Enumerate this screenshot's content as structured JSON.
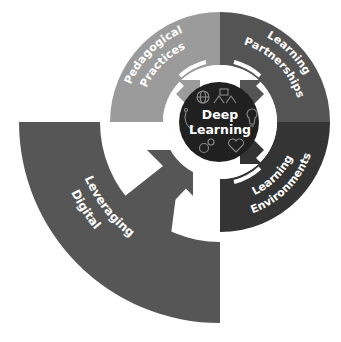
{
  "center": {
    "line1": "Deep",
    "line2": "Learning",
    "color": "#202020",
    "icons": [
      "globe-icon",
      "people-network-icon",
      "lightbulb-icon",
      "headset-icon",
      "gears-icon",
      "heart-icon"
    ]
  },
  "quadrants": [
    {
      "id": "pedagogical-practices",
      "line1": "Pedagogical",
      "line2": "Practices",
      "color": "#9b9b9b"
    },
    {
      "id": "learning-partnerships",
      "line1": "Learning",
      "line2": "Partnerships",
      "color": "#545454"
    },
    {
      "id": "learning-environments",
      "line1": "Learning",
      "line2": "Environments",
      "color": "#343434"
    },
    {
      "id": "leveraging-digital",
      "line1": "Leveraging",
      "line2": "Digital",
      "color": "#565656"
    }
  ]
}
